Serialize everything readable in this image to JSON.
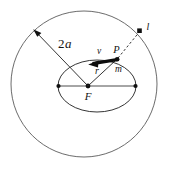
{
  "figure": {
    "type": "diagram",
    "width": 170,
    "height": 172,
    "background_color": "#ffffff",
    "stroke_color": "#555555",
    "ink_color": "#141414"
  },
  "labels": {
    "semi_major": "2",
    "semi_major_italic": "a",
    "velocity": "v",
    "point_p": "P",
    "mass": "m",
    "radius": "r",
    "focus": "F",
    "angular_momentum": "l"
  },
  "geometry": {
    "outer_circle": {
      "cx": 84,
      "cy": 84,
      "r": 73
    },
    "ellipse": {
      "cx": 97,
      "cy": 86,
      "rx": 39,
      "ry": 26
    },
    "focus_point": {
      "x": 88,
      "y": 86
    },
    "left_vertex": {
      "x": 58,
      "y": 86
    },
    "right_vertex": {
      "x": 136,
      "y": 86
    },
    "point_p": {
      "x": 117,
      "y": 59
    },
    "l_marker": {
      "x": 140,
      "y": 31
    },
    "two_a_arrow": {
      "x1": 88,
      "y1": 86,
      "x2": 34,
      "y2": 30
    }
  }
}
